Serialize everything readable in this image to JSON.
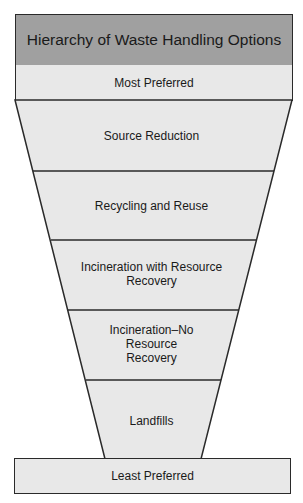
{
  "title": "Hierarchy of Waste Handling Options",
  "top_label": "Most Preferred",
  "bottom_label": "Least Preferred",
  "tiers": [
    {
      "label": "Source Reduction"
    },
    {
      "label": "Recycling and Reuse"
    },
    {
      "label": "Incineration with Resource Recovery",
      "lines": [
        "Incineration with Resource",
        "Recovery"
      ]
    },
    {
      "label": "Incineration–No Resource Recovery",
      "lines": [
        "Incineration–No",
        "Resource",
        "Recovery"
      ]
    },
    {
      "label": "Landfills"
    }
  ],
  "colors": {
    "title_fill": "#a0a0a0",
    "tier_fill": "#e8e8e8",
    "stroke": "#2a2a2a"
  }
}
